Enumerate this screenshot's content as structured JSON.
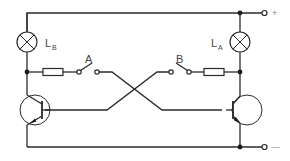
{
  "diagram": {
    "type": "circuit-schematic",
    "colors": {
      "line": "#2a2a2a",
      "label": "#444444",
      "terminal_label": "#888888",
      "background": "#ffffff"
    },
    "lamps": [
      {
        "id": "LB",
        "label": "L",
        "subscript": "B",
        "position": "left"
      },
      {
        "id": "LA",
        "label": "L",
        "subscript": "A",
        "position": "right"
      }
    ],
    "switches": [
      {
        "id": "A",
        "label": "A",
        "position": "left"
      },
      {
        "id": "B",
        "label": "B",
        "position": "right"
      }
    ],
    "resistors": [
      {
        "id": "R-left",
        "position": "left"
      },
      {
        "id": "R-right",
        "position": "right"
      }
    ],
    "transistors": [
      {
        "id": "T-left",
        "type": "NPN",
        "position": "left"
      },
      {
        "id": "T-right",
        "type": "NPN",
        "position": "right"
      }
    ],
    "terminals": [
      {
        "id": "positive",
        "label": "+"
      },
      {
        "id": "negative",
        "label": "—"
      }
    ]
  }
}
